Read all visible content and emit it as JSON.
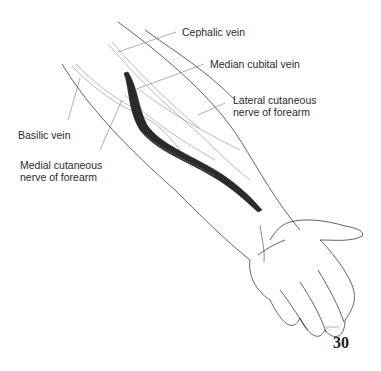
{
  "figure": {
    "page_number": "30",
    "artist_signature": "signature"
  },
  "labels": [
    {
      "id": "cephalic-vein",
      "lines": [
        "Cephalic vein"
      ]
    },
    {
      "id": "median-cubital-vein",
      "lines": [
        "Median cubital vein"
      ]
    },
    {
      "id": "lateral-cutaneous-nerve",
      "lines": [
        "Lateral cutaneous",
        "nerve of forearm"
      ]
    },
    {
      "id": "basilic-vein",
      "lines": [
        "Basilic vein"
      ]
    },
    {
      "id": "medial-cutaneous-nerve",
      "lines": [
        "Medial cutaneous",
        "nerve of forearm"
      ]
    }
  ],
  "colors": {
    "ink": "#2a2a2a",
    "light_line": "#8a8a8a",
    "background": "#ffffff"
  }
}
